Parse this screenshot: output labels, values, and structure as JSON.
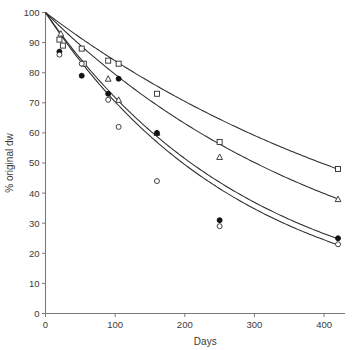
{
  "chart_data": {
    "type": "line",
    "title": "",
    "subtitle": "",
    "xlabel": "Days",
    "ylabel": "% original dw",
    "xlim": [
      0,
      430
    ],
    "ylim": [
      0,
      100
    ],
    "xticks": [
      0,
      100,
      200,
      300,
      400
    ],
    "xticklabels": [
      "0",
      "100",
      "200",
      "300",
      "400"
    ],
    "yticks": [
      0,
      10,
      20,
      30,
      40,
      50,
      60,
      70,
      80,
      90,
      100
    ],
    "yticklabels": [
      "0",
      "10",
      "20",
      "30",
      "40",
      "50",
      "60",
      "70",
      "80",
      "90",
      "100"
    ],
    "grid": false,
    "legend": "none",
    "annotations": [],
    "series": [
      {
        "name": "open-square",
        "marker": "open-square",
        "decay_k": 0.00175,
        "y0": 100,
        "fit_label": "slowest decay",
        "x": [
          20,
          25,
          52,
          55,
          90,
          105,
          160,
          250,
          420
        ],
        "values": [
          91,
          89,
          88,
          83,
          84,
          83,
          73,
          57,
          48
        ]
      },
      {
        "name": "open-triangle",
        "marker": "open-triangle",
        "decay_k": 0.0023,
        "y0": 100,
        "fit_label": "intermediate decay",
        "x": [
          22,
          90,
          105,
          160,
          250,
          420
        ],
        "values": [
          93,
          78,
          71,
          60,
          52,
          38
        ]
      },
      {
        "name": "filled-circle",
        "marker": "filled-circle",
        "decay_k": 0.00332,
        "y0": 100,
        "fit_label": "fast decay",
        "x": [
          20,
          52,
          90,
          105,
          160,
          250,
          420
        ],
        "values": [
          87,
          79,
          73,
          78,
          60,
          31,
          25
        ]
      },
      {
        "name": "open-circle",
        "marker": "open-circle",
        "decay_k": 0.00352,
        "y0": 100,
        "fit_label": "fastest decay",
        "x": [
          20,
          52,
          90,
          105,
          160,
          250,
          420
        ],
        "values": [
          86,
          83,
          71,
          62,
          44,
          29,
          23
        ]
      }
    ]
  },
  "colors": {
    "axis": "#7a7a7a",
    "curve": "#2b2b2b",
    "marker_fill_open": "#ffffff",
    "marker_fill_solid": "#121212",
    "text": "#3a3a3a",
    "background": "#ffffff"
  }
}
